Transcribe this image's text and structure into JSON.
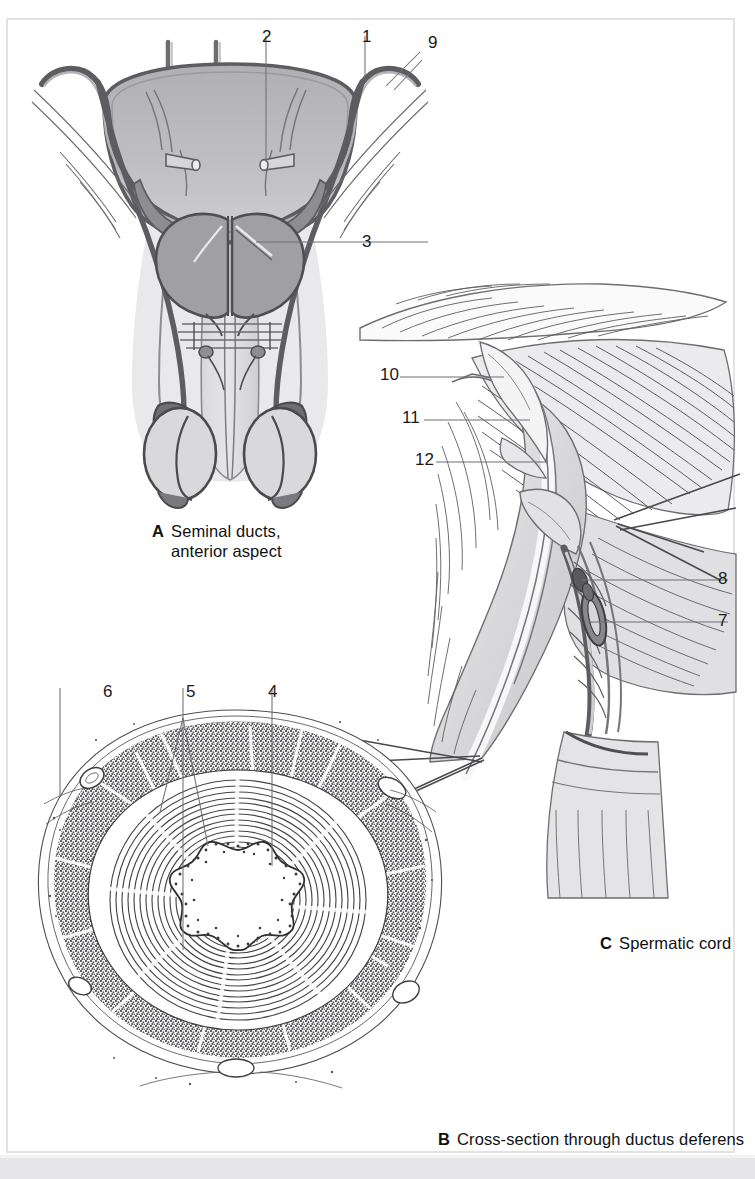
{
  "figure": {
    "frame_color": "#e2e2e4",
    "background": "#ffffff",
    "bottom_band_color": "#e7e7e9"
  },
  "panels": [
    {
      "id": "A",
      "letter": "A",
      "caption": "Seminal ducts,\nanterior aspect",
      "labels": [
        "2",
        "1",
        "9",
        "3"
      ]
    },
    {
      "id": "B",
      "letter": "B",
      "caption": "Cross-section through ductus deferens",
      "labels": [
        "6",
        "5",
        "4"
      ]
    },
    {
      "id": "C",
      "letter": "C",
      "caption": "Spermatic cord",
      "labels": [
        "10",
        "11",
        "12",
        "8",
        "7"
      ]
    }
  ],
  "labels": {
    "a_2": "2",
    "a_1": "1",
    "a_9": "9",
    "a_3": "3",
    "b_6": "6",
    "b_5": "5",
    "b_4": "4",
    "c_10": "10",
    "c_11": "11",
    "c_12": "12",
    "c_8": "8",
    "c_7": "7"
  },
  "captions": {
    "a_letter": "A",
    "a_text": "Seminal ducts,\nanterior aspect",
    "b_letter": "B",
    "b_text": "Cross-section through ductus deferens",
    "c_letter": "C",
    "c_text": "Spermatic cord"
  },
  "colors": {
    "ink": "#3a3a3e",
    "mid_gray": "#a0a0a3",
    "light_gray": "#d4d4d6",
    "pale_gray": "#c6c6c9",
    "leader": "#6f6f73"
  }
}
